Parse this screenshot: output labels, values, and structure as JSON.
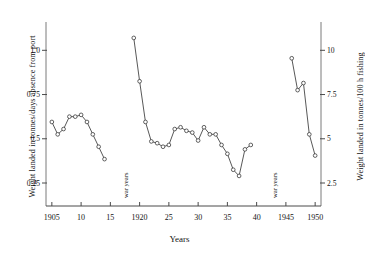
{
  "chart_data": {
    "type": "line",
    "title": "",
    "xlabel": "Years",
    "ylabel_left": "Weight landed in tonnes/days absence from port",
    "ylabel_right": "Weight landed in tonnes/100 h fishing",
    "xlim": [
      1904,
      1951
    ],
    "ylim_left": [
      0.12,
      1.16
    ],
    "ylim_right": [
      1.2,
      11.6
    ],
    "left_ticks": [
      "0.25",
      "0.5",
      "0.75",
      "1.0"
    ],
    "left_tick_values": [
      0.25,
      0.5,
      0.75,
      1.0
    ],
    "right_ticks": [
      "2.5",
      "5",
      "7.5",
      "10"
    ],
    "right_tick_values": [
      2.5,
      5,
      7.5,
      10
    ],
    "x_ticks": [
      "1905",
      "10",
      "15",
      "1920",
      "25",
      "30",
      "35",
      "40",
      "1945",
      "1950"
    ],
    "x_tick_values": [
      1905,
      1910,
      1915,
      1920,
      1925,
      1930,
      1935,
      1940,
      1945,
      1950
    ],
    "grid": false,
    "legend": "none",
    "marker": "open-circle",
    "annotations": [
      {
        "text": "war years",
        "x": 1916.5,
        "orientation": "vertical"
      },
      {
        "text": "war years",
        "x": 1942.0,
        "orientation": "vertical"
      }
    ],
    "series": [
      {
        "name": "pre-WWI",
        "x": [
          1905,
          1906,
          1907,
          1908,
          1909,
          1910,
          1911,
          1912,
          1913,
          1914
        ],
        "y": [
          0.595,
          0.525,
          0.555,
          0.625,
          0.625,
          0.635,
          0.595,
          0.525,
          0.455,
          0.385
        ]
      },
      {
        "name": "interwar",
        "x": [
          1919,
          1920,
          1921,
          1922,
          1923,
          1924,
          1925,
          1926,
          1927,
          1928,
          1929,
          1930,
          1931,
          1932,
          1933,
          1934,
          1935,
          1936,
          1937,
          1938,
          1939
        ],
        "y": [
          1.07,
          0.825,
          0.595,
          0.485,
          0.475,
          0.455,
          0.465,
          0.555,
          0.565,
          0.545,
          0.535,
          0.49,
          0.565,
          0.525,
          0.525,
          0.465,
          0.415,
          0.325,
          0.29,
          0.44,
          0.465
        ]
      },
      {
        "name": "post-WWII",
        "x": [
          1946,
          1947,
          1948,
          1949,
          1950
        ],
        "y": [
          0.955,
          0.775,
          0.815,
          0.525,
          0.405
        ]
      }
    ]
  },
  "axes": {
    "x_label": "Years",
    "y_left_label": "Weight landed in tonnes/days absence from port",
    "y_right_label": "Weight landed in tonnes/100 h fishing"
  },
  "annotations": {
    "war1": "war years",
    "war2": "war years"
  }
}
